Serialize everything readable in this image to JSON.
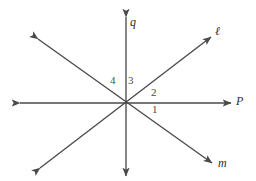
{
  "figure": {
    "type": "geometry-diagram",
    "background_color": "#ffffff",
    "stroke_color": "#4a4a4a",
    "label_color": "#3a3a3a",
    "width": 256,
    "height": 181,
    "intersection_point": {
      "x": 126,
      "y": 103
    }
  },
  "lines": [
    {
      "name": "q",
      "label": "q",
      "orientation": "vertical",
      "double_headed": true,
      "x1": 126,
      "y1": 17,
      "x2": 126,
      "y2": 176,
      "label_x": 130,
      "label_y": 16
    },
    {
      "name": "P",
      "label": "P",
      "orientation": "horizontal",
      "double_headed": true,
      "x1": 20,
      "y1": 103,
      "x2": 231,
      "y2": 103,
      "label_x": 236,
      "label_y": 95
    },
    {
      "name": "l",
      "label": "ℓ",
      "orientation": "diagonal-rising",
      "double_headed": true,
      "x1": 40,
      "y1": 168,
      "x2": 211,
      "y2": 37,
      "label_x": 215,
      "label_y": 25
    },
    {
      "name": "m",
      "label": "m",
      "orientation": "diagonal-falling",
      "double_headed": true,
      "x1": 38,
      "y1": 39,
      "x2": 212,
      "y2": 163,
      "label_x": 218,
      "label_y": 157
    }
  ],
  "angles": [
    {
      "name": "angle-1",
      "label": "1",
      "x": 152,
      "y": 104,
      "between": [
        "P",
        "m"
      ]
    },
    {
      "name": "angle-2",
      "label": "2",
      "x": 151,
      "y": 87,
      "between": [
        "l",
        "P"
      ]
    },
    {
      "name": "angle-3",
      "label": "3",
      "x": 128,
      "y": 75,
      "between": [
        "q",
        "l"
      ]
    },
    {
      "name": "angle-4",
      "label": "4",
      "x": 110,
      "y": 75,
      "between": [
        "m",
        "q"
      ]
    }
  ]
}
